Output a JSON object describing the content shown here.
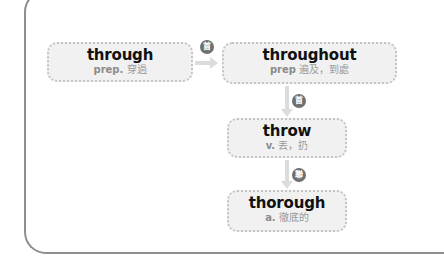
{
  "nodes": {
    "through": {
      "word": "through",
      "pos": "prep.",
      "meaning": "穿過"
    },
    "throughout": {
      "word": "throughout",
      "pos": "prep",
      "meaning": "遍及，到處"
    },
    "throw": {
      "word": "throw",
      "pos": "v.",
      "meaning": "丟，扔"
    },
    "thorough": {
      "word": "thorough",
      "pos": "a.",
      "meaning": "徹底的"
    }
  },
  "badges": {
    "through_to_throughout": "首",
    "throughout_to_throw": "首",
    "throw_to_thorough": "聯"
  },
  "colors": {
    "node_fill": "#f1f1f1",
    "node_border": "#c4c4c4",
    "badge": "#6f6f6f",
    "arrow": "#dcdcdc",
    "frame": "#8e8e8e"
  }
}
